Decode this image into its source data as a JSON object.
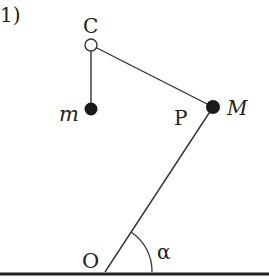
{
  "figure": {
    "number_label": "1)",
    "labels": {
      "C": "C",
      "m": "m",
      "P": "P",
      "M": "M",
      "O": "O",
      "alpha": "α"
    },
    "colors": {
      "line": "#333333",
      "point_fill": "#1a1a1a",
      "background": "#ffffff"
    }
  }
}
